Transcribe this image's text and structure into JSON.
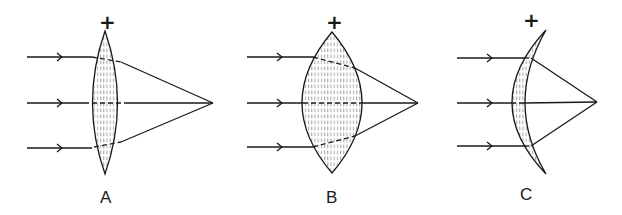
{
  "colors": {
    "ink": "#1a1a1a",
    "hatch": "#9a9a9a",
    "background": "#ffffff"
  },
  "lenses": [
    {
      "id": "A",
      "label": "A",
      "sign": "+",
      "type": "biconvex (thin)",
      "focal_point": [
        213,
        103
      ]
    },
    {
      "id": "B",
      "label": "B",
      "sign": "+",
      "type": "biconvex (thick)",
      "focal_point": [
        418,
        103
      ]
    },
    {
      "id": "C",
      "label": "C",
      "sign": "+",
      "type": "positive meniscus",
      "focal_point": [
        597,
        103
      ]
    }
  ],
  "incident_rays_per_lens": 3
}
